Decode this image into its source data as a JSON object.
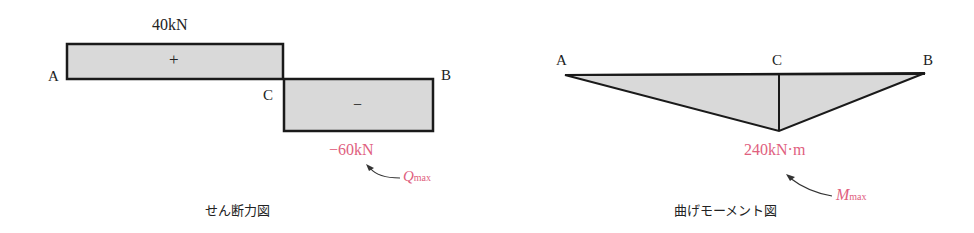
{
  "shear_diagram": {
    "title": "せん断力図",
    "points": {
      "A": "A",
      "C": "C",
      "B": "B"
    },
    "positive_value": "40kN",
    "positive_sign": "+",
    "negative_value": "−60kN",
    "negative_sign": "−",
    "max_label": "Q",
    "max_sub": "max"
  },
  "moment_diagram": {
    "title": "曲げモーメント図",
    "points": {
      "A": "A",
      "C": "C",
      "B": "B"
    },
    "max_value": "240kN·m",
    "max_label": "M",
    "max_sub": "max"
  },
  "colors": {
    "fill": "#d9d9d9",
    "stroke": "#1a1a1a",
    "accent": "#e0607e"
  }
}
